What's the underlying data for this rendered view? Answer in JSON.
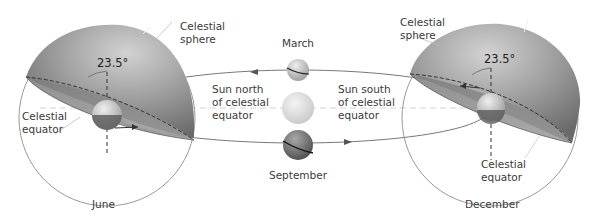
{
  "diagram": {
    "colors": {
      "sphere_dark": "#6d6d6d",
      "sphere_light": "#cfcfcf",
      "outline": "#8a8a8a",
      "orbit_line": "#777777",
      "text": "#3a3a3a",
      "sun": "#e4e4e4"
    },
    "left_panel": {
      "month": "June",
      "sphere_label": "Celestial\nsphere",
      "equator_label": "Celestial\nequator",
      "tilt": "23.5°"
    },
    "right_panel": {
      "month": "December",
      "sphere_label": "Celestial\nsphere",
      "equator_label": "Celestial\nequator",
      "tilt": "23.5°"
    },
    "center": {
      "top_label": "March",
      "bottom_label": "September",
      "north_label": "Sun north\nof celestial\nequator",
      "south_label": "Sun south\nof celestial\nequator"
    }
  }
}
